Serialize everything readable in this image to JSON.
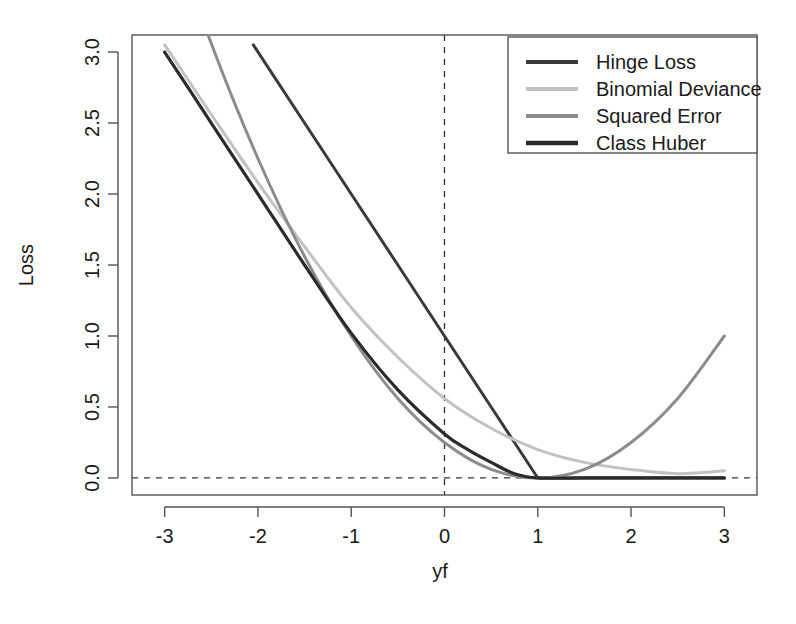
{
  "chart_data": {
    "type": "line",
    "title": "",
    "xlabel": "yf",
    "ylabel": "Loss",
    "xlim": [
      -3.35,
      3.35
    ],
    "ylim": [
      -0.12,
      3.12
    ],
    "xticks": [
      -3,
      -2,
      -1,
      0,
      1,
      2,
      3
    ],
    "xticklabels": [
      "-3",
      "-2",
      "-1",
      "0",
      "1",
      "2",
      "3"
    ],
    "yticks": [
      0.0,
      0.5,
      1.0,
      1.5,
      2.0,
      2.5,
      3.0
    ],
    "yticklabels": [
      "0.0",
      "0.5",
      "1.0",
      "1.5",
      "2.0",
      "2.5",
      "3.0"
    ],
    "grid": false,
    "reference_lines": [
      {
        "name": "zero-loss-line",
        "orientation": "horizontal",
        "value": 0.0,
        "style": "dashed"
      },
      {
        "name": "zero-margin-line",
        "orientation": "vertical",
        "value": 0.0,
        "style": "dashed"
      }
    ],
    "legend": {
      "position": "top-right",
      "entries": [
        "Hinge Loss",
        "Binomial Deviance",
        "Squared Error",
        "Class Huber"
      ]
    },
    "series": [
      {
        "name": "Hinge Loss",
        "color": "#3a3a3a",
        "width": 3.0,
        "x": [
          -2.05,
          -1.5,
          -1.0,
          -0.5,
          0.0,
          0.5,
          1.0,
          1.5,
          2.0,
          2.5,
          3.0
        ],
        "values": [
          3.05,
          2.5,
          2.0,
          1.5,
          1.0,
          0.5,
          0.0,
          0.0,
          0.0,
          0.0,
          0.0
        ]
      },
      {
        "name": "Binomial Deviance",
        "color": "#c2c2c2",
        "width": 3.0,
        "x": [
          -3.0,
          -2.5,
          -2.0,
          -1.5,
          -1.0,
          -0.5,
          0.0,
          0.5,
          1.0,
          1.5,
          2.0,
          2.5,
          3.0
        ],
        "values": [
          3.05,
          2.56,
          2.08,
          1.63,
          1.2,
          0.85,
          0.56,
          0.35,
          0.2,
          0.11,
          0.06,
          0.03,
          0.05
        ]
      },
      {
        "name": "Squared Error",
        "color": "#8c8c8c",
        "width": 3.0,
        "x": [
          -3.0,
          -2.5,
          -2.0,
          -1.5,
          -1.0,
          -0.5,
          0.0,
          0.5,
          1.0,
          1.5,
          2.0,
          2.5,
          3.0
        ],
        "values": [
          4.0,
          3.06,
          2.25,
          1.56,
          1.0,
          0.56,
          0.25,
          0.06,
          0.0,
          0.06,
          0.25,
          0.56,
          1.0
        ]
      },
      {
        "name": "Class Huber",
        "color": "#2b2b2b",
        "width": 3.2,
        "x": [
          -3.0,
          -2.5,
          -2.0,
          -1.5,
          -1.0,
          -0.5,
          0.0,
          0.25,
          0.5,
          0.75,
          1.0,
          1.5,
          2.0,
          2.5,
          3.0
        ],
        "values": [
          3.0,
          2.5,
          2.0,
          1.5,
          1.02,
          0.62,
          0.31,
          0.2,
          0.11,
          0.03,
          0.0,
          0.0,
          0.0,
          0.0,
          0.0
        ]
      }
    ]
  },
  "axis": {
    "x_title": "yf",
    "y_title": "Loss"
  }
}
